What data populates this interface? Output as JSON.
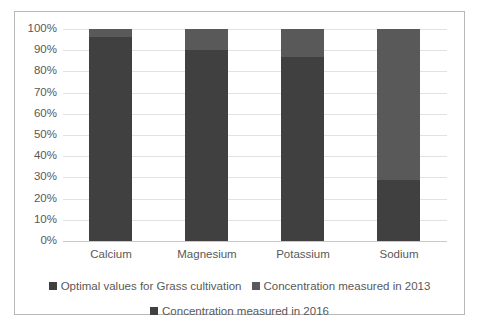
{
  "chart_data": {
    "type": "bar",
    "subtype": "stacked-100-percent",
    "title": "",
    "xlabel": "",
    "ylabel": "",
    "ylim": [
      0,
      100
    ],
    "ytick_labels": [
      "100%",
      "90%",
      "80%",
      "70%",
      "60%",
      "50%",
      "40%",
      "30%",
      "20%",
      "10%",
      "0%"
    ],
    "ytick_values": [
      100,
      90,
      80,
      70,
      60,
      50,
      40,
      30,
      20,
      10,
      0
    ],
    "grid": true,
    "legend_position": "bottom",
    "categories": [
      "Calcium",
      "Magnesium",
      "Potassium",
      "Sodium"
    ],
    "series": [
      {
        "name": "Optimal values for Grass cultivation",
        "color": "#404040",
        "values": [
          null,
          null,
          null,
          null
        ]
      },
      {
        "name": "Concentration measured in 2013",
        "color": "#595959",
        "values": [
          4,
          10,
          13,
          71
        ]
      },
      {
        "name": "Concentration measured in 2016",
        "color": "#404040",
        "values": [
          96,
          90,
          87,
          29
        ]
      }
    ],
    "bars": [
      {
        "category": "Calcium",
        "lower_value": 96,
        "upper_value": 4
      },
      {
        "category": "Magnesium",
        "lower_value": 90,
        "upper_value": 10
      },
      {
        "category": "Potassium",
        "lower_value": 87,
        "upper_value": 13
      },
      {
        "category": "Sodium",
        "lower_value": 29,
        "upper_value": 71
      }
    ]
  },
  "legend": {
    "rows": [
      [
        {
          "label": "Optimal values for Grass cultivation",
          "color": "#404040"
        },
        {
          "label": "Concentration measured in 2013",
          "color": "#595959"
        }
      ],
      [
        {
          "label": "Concentration measured in 2016",
          "color": "#404040"
        }
      ]
    ]
  },
  "colors": {
    "segment_lower": "#404040",
    "segment_upper": "#595959",
    "gridline": "#e2e2e2",
    "axis": "#c9c9c9",
    "border": "#b8b8b8",
    "tick_text": "#595959",
    "background": "#ffffff"
  }
}
